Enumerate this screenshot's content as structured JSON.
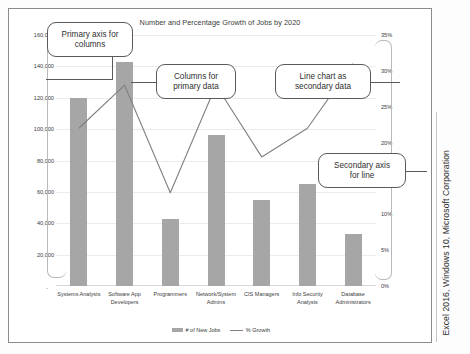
{
  "chart_data": {
    "type": "bar",
    "title": "Number and Percentage Growth of Jobs by 2020",
    "xlabel": "",
    "ylabel": "",
    "grid": true,
    "legend_position": "bottom",
    "categories": [
      "Systems Analysts",
      "Software App Developers",
      "Programmers",
      "Network/System Admins",
      "CIS Managers",
      "Info Security Analysts",
      "Database Administrators"
    ],
    "series": [
      {
        "name": "# of New Jobs",
        "type": "bar",
        "axis": "primary",
        "color": "#a6a6a6",
        "values": [
          120000,
          143000,
          43000,
          96000,
          55000,
          65000,
          33000
        ]
      },
      {
        "name": "% Growth",
        "type": "line",
        "axis": "secondary",
        "color": "#808080",
        "values": [
          0.22,
          0.28,
          0.13,
          0.28,
          0.18,
          0.22,
          0.31
        ]
      }
    ],
    "ylim": [
      0,
      160000
    ],
    "y2lim": [
      0,
      0.35
    ],
    "ytick_labels": [
      "20,000",
      "40,000",
      "60,000",
      "80,000",
      "100,000",
      "120,000",
      "140,000",
      "160,000"
    ],
    "ytick_values": [
      20000,
      40000,
      60000,
      80000,
      100000,
      120000,
      140000,
      160000
    ],
    "y2tick_labels": [
      "0%",
      "5%",
      "10%",
      "15%",
      "20%",
      "25%",
      "30%",
      "35%"
    ],
    "y2tick_values": [
      0,
      0.05,
      0.1,
      0.15,
      0.2,
      0.25,
      0.3,
      0.35
    ],
    "zero_tick_label": "-",
    "annotations": [
      "Primary axis for columns",
      "Columns for primary data",
      "Line chart as secondary data",
      "Secondary axis for line"
    ]
  },
  "chart": {
    "title": "Number and Percentage Growth of Jobs by 2020",
    "zero_tick_label": "-",
    "categories": [
      {
        "line1": "Systems Analysts",
        "line2": ""
      },
      {
        "line1": "Software App",
        "line2": "Developers"
      },
      {
        "line1": "Programmers",
        "line2": ""
      },
      {
        "line1": "Network/System",
        "line2": "Admins"
      },
      {
        "line1": "CIS Managers",
        "line2": ""
      },
      {
        "line1": "Info Security",
        "line2": "Analysts"
      },
      {
        "line1": "Database",
        "line2": "Administrators"
      }
    ],
    "y_ticks": [
      "160,000",
      "140,000",
      "120,000",
      "100,000",
      "80,000",
      "60,000",
      "40,000",
      "20,000"
    ],
    "y2_ticks": [
      "35%",
      "30%",
      "25%",
      "20%",
      "15%",
      "10%",
      "5%",
      "0%"
    ],
    "legend": [
      {
        "label": "# of New Jobs",
        "marker": "bar-swatch"
      },
      {
        "label": "% Growth",
        "marker": "line-swatch"
      }
    ]
  },
  "callouts": [
    {
      "id": "primary-axis",
      "line1": "Primary axis for",
      "line2": "columns"
    },
    {
      "id": "columns-primary",
      "line1": "Columns for",
      "line2": "primary data"
    },
    {
      "id": "line-secondary",
      "line1": "Line chart as",
      "line2": "secondary data"
    },
    {
      "id": "secondary-axis",
      "line1": "Secondary axis",
      "line2": "for line"
    }
  ],
  "caption": {
    "text": "Excel 2016, Windows 10, Microsoft Corporation"
  },
  "colors": {
    "bar": "#a6a6a6",
    "line": "#808080",
    "frame": "#8a8a8a",
    "grid": "#eceaea",
    "callout_border": "#5a5a5a",
    "text": "#3b3b3b"
  }
}
